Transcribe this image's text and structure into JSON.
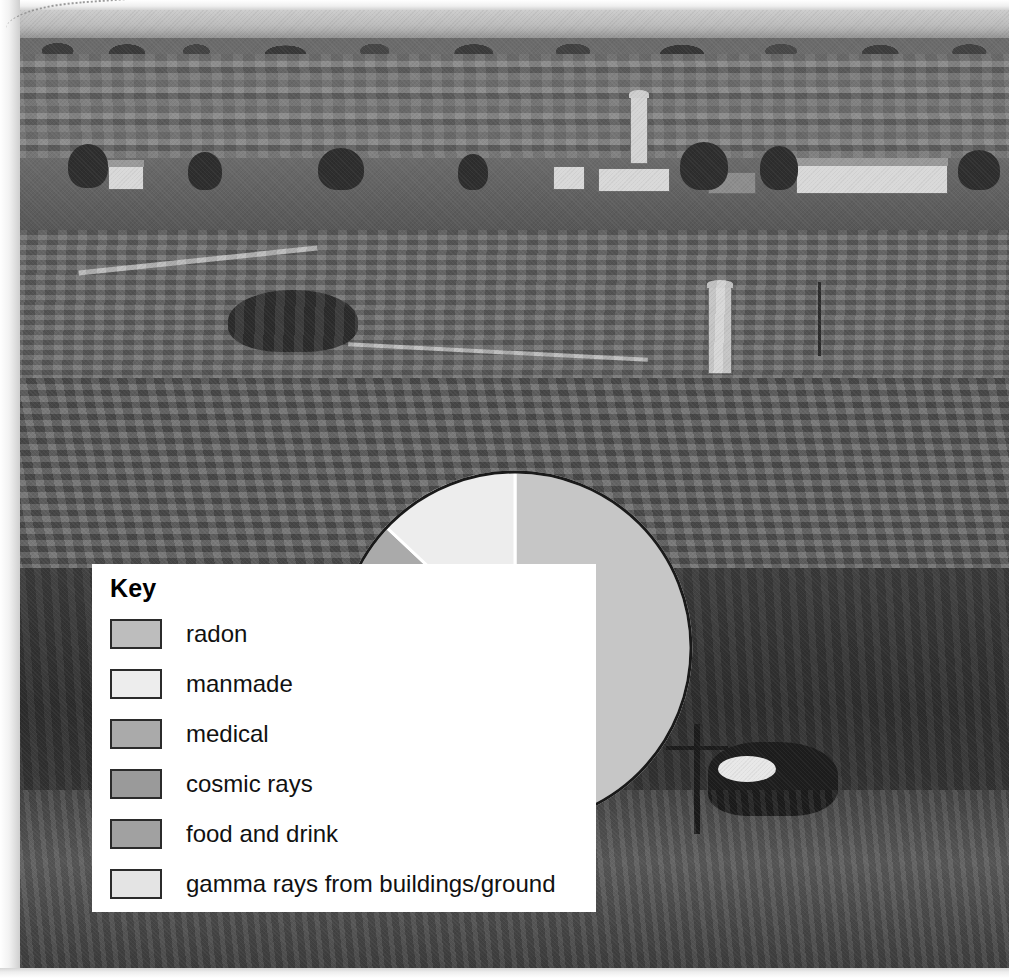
{
  "figure": {
    "type": "photo-with-pie-overlay",
    "background_photo_description": "black and white photograph of rolling farmland with striped crop fields, farm buildings, silos and a cow in the foreground"
  },
  "key": {
    "title": "Key",
    "items": [
      {
        "label": "radon",
        "color": "#bdbdbd"
      },
      {
        "label": "manmade",
        "color": "#ededed"
      },
      {
        "label": "medical",
        "color": "#aaaaaa"
      },
      {
        "label": "cosmic rays",
        "color": "#9a9a9a"
      },
      {
        "label": "food and drink",
        "color": "#a1a1a1"
      },
      {
        "label": "gamma rays from buildings/ground",
        "color": "#e4e4e4"
      }
    ]
  },
  "chart_data": {
    "type": "pie",
    "title": "",
    "categories": [
      "radon",
      "gamma rays from buildings/ground",
      "food and drink",
      "cosmic rays",
      "medical",
      "manmade"
    ],
    "values": [
      50,
      2,
      12,
      10,
      13,
      13
    ],
    "units": "percent",
    "start_angle_deg": 0,
    "direction": "clockwise",
    "colors": [
      "#c6c6c6",
      "#e4e4e4",
      "#a1a1a1",
      "#9a9a9a",
      "#aaaaaa",
      "#ededed"
    ],
    "slice_separator_color": "#ffffff",
    "outline_color": "#1a1a1a",
    "legend": "Key",
    "legend_position": "left",
    "grid": false
  }
}
